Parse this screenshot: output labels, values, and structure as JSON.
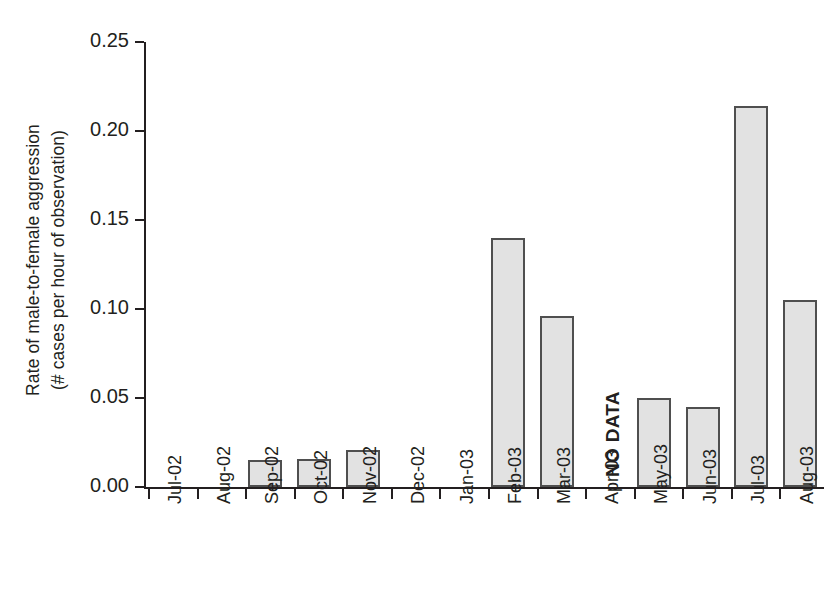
{
  "chart_data": {
    "type": "bar",
    "title": "",
    "xlabel": "",
    "ylabel_line1": "Rate of male-to-female aggression",
    "ylabel_line2": "(# cases per hour of observation)",
    "categories": [
      "Jul-02",
      "Aug-02",
      "Sep-02",
      "Oct-02",
      "Nov-02",
      "Dec-02",
      "Jan-03",
      "Feb-03",
      "Mar-03",
      "Apr-03",
      "May-03",
      "Jun-03",
      "Jul-03",
      "Aug-03"
    ],
    "values": [
      0.0,
      0.0,
      0.015,
      0.016,
      0.021,
      0.0,
      0.0,
      0.14,
      0.096,
      null,
      0.05,
      0.045,
      0.214,
      0.105
    ],
    "ylim": [
      0.0,
      0.25
    ],
    "ytick_labels": [
      "0.00",
      "0.05",
      "0.10",
      "0.15",
      "0.20",
      "0.25"
    ],
    "ytick_values": [
      0.0,
      0.05,
      0.1,
      0.15,
      0.2,
      0.25
    ],
    "grid": false,
    "legend": false,
    "legend_position": "none",
    "annotations": [
      {
        "category": "Apr-03",
        "text": "NO DATA",
        "orientation": "vertical"
      }
    ],
    "bar_fill_color": "#e2e2e2",
    "bar_edge_color": "#4f4f4f",
    "axis_color": "#231f20",
    "background_color": "#ffffff"
  }
}
